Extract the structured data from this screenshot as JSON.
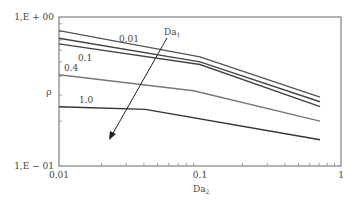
{
  "chart_data": {
    "type": "line",
    "title": "",
    "xlabel": "Da2",
    "ylabel": "ρ",
    "xscale": "log",
    "yscale": "log",
    "xlim": [
      0.01,
      1
    ],
    "ylim": [
      0.1,
      1
    ],
    "x_tick_labels": [
      "0.01",
      "0.1",
      "1"
    ],
    "y_tick_labels": [
      "1,E - 01",
      "1,E + 00"
    ],
    "grid": false,
    "annotation": {
      "text": "Da1",
      "arrow": "direction of increasing Da1"
    },
    "series": [
      {
        "name": "0.01",
        "x": [
          0.01,
          0.1,
          0.71
        ],
        "y": [
          0.81,
          0.54,
          0.29
        ],
        "color": "#555555"
      },
      {
        "name": "",
        "x": [
          0.01,
          0.1,
          0.71
        ],
        "y": [
          0.72,
          0.5,
          0.27
        ],
        "color": "#444444"
      },
      {
        "name": "0.1",
        "x": [
          0.01,
          0.1,
          0.71
        ],
        "y": [
          0.66,
          0.48,
          0.25
        ],
        "color": "#444444"
      },
      {
        "name": "0.4",
        "x": [
          0.01,
          0.09,
          0.71
        ],
        "y": [
          0.41,
          0.32,
          0.2
        ],
        "color": "#777777"
      },
      {
        "name": "1.0",
        "x": [
          0.01,
          0.041,
          0.71
        ],
        "y": [
          0.25,
          0.24,
          0.15
        ],
        "color": "#333333"
      }
    ]
  },
  "labels": {
    "y_top": "1,E + 00",
    "y_bottom": "1,E − 01",
    "y_axis": "ρ",
    "x_left": "0.01",
    "x_mid": "0.1",
    "x_right": "1",
    "x_axis_main": "Da",
    "x_axis_sub": "2",
    "annot_main": "Da",
    "annot_sub": "1",
    "s0": "0.01",
    "s2": "0.1",
    "s3": "0.4",
    "s4": "1.0"
  }
}
